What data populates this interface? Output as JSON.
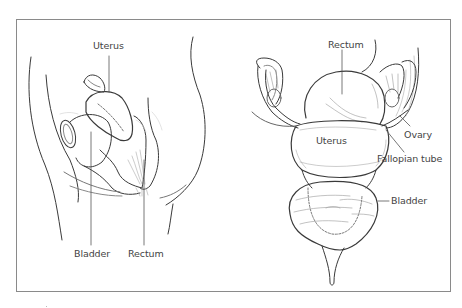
{
  "figure": {
    "type": "anatomical line illustration",
    "panels": [
      {
        "id": "side-view",
        "view": "sagittal (side) view of female pelvis",
        "labels": [
          {
            "text": "Uterus",
            "x": 96,
            "y": 42
          },
          {
            "text": "Bladder",
            "x": 74,
            "y": 250
          },
          {
            "text": "Rectum",
            "x": 128,
            "y": 250
          }
        ]
      },
      {
        "id": "front-view",
        "view": "frontal view of female reproductive organs",
        "labels": [
          {
            "text": "Rectum",
            "x": 330,
            "y": 40
          },
          {
            "text": "Ovary",
            "x": 407,
            "y": 130
          },
          {
            "text": "Uterus",
            "x": 316,
            "y": 136
          },
          {
            "text": "Fallopian tube",
            "x": 377,
            "y": 155
          },
          {
            "text": "Bladder",
            "x": 391,
            "y": 196
          }
        ]
      }
    ],
    "colors": {
      "line": "#3a3a3a",
      "frame": "#8a8a8a",
      "label": "#444444",
      "background": "#ffffff"
    }
  }
}
